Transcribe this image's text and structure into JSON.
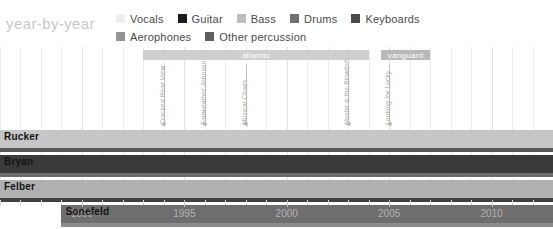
{
  "header": {
    "title": "year-by-year"
  },
  "legend": {
    "rows": [
      [
        {
          "label": "Vocals",
          "color": "#efefef"
        },
        {
          "label": "Guitar",
          "color": "#1c1c1c"
        },
        {
          "label": "Bass",
          "color": "#bdbdbd"
        },
        {
          "label": "Drums",
          "color": "#707070"
        },
        {
          "label": "Keyboards",
          "color": "#4a4a4a"
        }
      ],
      [
        {
          "label": "Aerophones",
          "color": "#949494"
        },
        {
          "label": "Other percussion",
          "color": "#5e5e5e"
        }
      ]
    ]
  },
  "chart_data": {
    "type": "bar",
    "title": "year-by-year",
    "xlabel": "",
    "ylabel": "",
    "xlim": [
      1986,
      2013
    ],
    "grid": true,
    "legend_position": "top",
    "categories": [
      "Rucker",
      "Bryan",
      "Felber",
      "Sonefeld"
    ],
    "xticks": [
      1990,
      1995,
      2000,
      2005,
      2010
    ],
    "xtick_labels": [
      "1990",
      "1995",
      "2000",
      "2005",
      "2010"
    ],
    "series": [
      {
        "name": "Rucker",
        "start": 1986,
        "end": 2013,
        "bar_color": "#c6c6c6",
        "under_color": "#585858",
        "role_primary": "Vocals",
        "role_secondary": "Guitar"
      },
      {
        "name": "Bryan",
        "start": 1986,
        "end": 2013,
        "bar_color": "#3a3a3a",
        "under_color": "#6e6e6e",
        "role_primary": "Guitar",
        "role_secondary": "Drums"
      },
      {
        "name": "Felber",
        "start": 1986,
        "end": 2013,
        "bar_color": "#b0b0b0",
        "under_color": "#3f3f3f",
        "role_primary": "Bass",
        "role_secondary": "Keyboards"
      },
      {
        "name": "Sonefeld",
        "start": 1989,
        "end": 2013,
        "bar_color": "#6e6e6e",
        "under_color": "#8c8c8c",
        "role_primary": "Drums",
        "role_secondary": "Other percussion"
      }
    ],
    "record_labels": [
      {
        "name": "atlantic",
        "start": 1993,
        "end": 2004,
        "color": "#cfcfcf"
      },
      {
        "name": "vanguard",
        "start": 2004.6,
        "end": 2007,
        "color": "#b9b9b9"
      }
    ],
    "albums": [
      {
        "title": "Cracked Rear View",
        "year": 1994
      },
      {
        "title": "Fairweather Johnson",
        "year": 1996
      },
      {
        "title": "Musical Chairs",
        "year": 1998
      },
      {
        "title": "Hootie & the Blowfish",
        "year": 2003
      },
      {
        "title": "Looking for Lucky",
        "year": 2005
      }
    ]
  }
}
